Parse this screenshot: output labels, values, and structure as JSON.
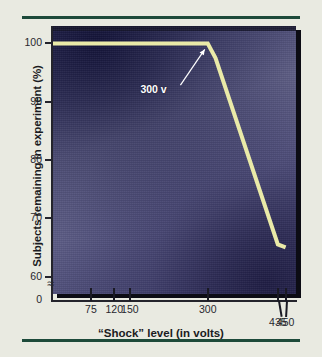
{
  "figure": {
    "background_color": "#e9eae1",
    "rule_color": "#1d4a3a",
    "plot_background_color": "#5a5a84",
    "line_color": "#eaeaa8",
    "annotation_color": "#ffffff"
  },
  "chart_data": {
    "type": "line",
    "title": "",
    "subtitle": "",
    "xlabel": "“Shock” level (in volts)",
    "ylabel": "Subjects remaining in experiment (%)",
    "xlim": [
      0,
      470
    ],
    "ylim": [
      57,
      103
    ],
    "grid": false,
    "legend": "none",
    "y_axis_break": true,
    "y_axis_break_glyph": "≈",
    "x_ticks": [
      {
        "value": 75,
        "label": "75",
        "label_offset": "normal"
      },
      {
        "value": 120,
        "label": "120",
        "label_offset": "normal"
      },
      {
        "value": 150,
        "label": "150",
        "label_offset": "normal"
      },
      {
        "value": 300,
        "label": "300",
        "label_offset": "normal"
      },
      {
        "value": 435,
        "label": "435",
        "label_offset": "low"
      },
      {
        "value": 450,
        "label": "450",
        "label_offset": "low"
      }
    ],
    "y_ticks": [
      {
        "value": 100,
        "label": "100"
      },
      {
        "value": 90,
        "label": "90"
      },
      {
        "value": 80,
        "label": "80"
      },
      {
        "value": 70,
        "label": "70"
      },
      {
        "value": 60,
        "label": "60"
      },
      {
        "value": 0,
        "label": "0"
      }
    ],
    "series": [
      {
        "name": "Subjects remaining",
        "color": "#eaeaa8",
        "points": [
          {
            "x": 0,
            "y": 100.0
          },
          {
            "x": 75,
            "y": 100.0
          },
          {
            "x": 120,
            "y": 100.0
          },
          {
            "x": 150,
            "y": 100.0
          },
          {
            "x": 300,
            "y": 100.0
          },
          {
            "x": 315,
            "y": 97.5
          },
          {
            "x": 435,
            "y": 65.5
          },
          {
            "x": 450,
            "y": 65.0
          }
        ]
      }
    ],
    "annotations": [
      {
        "text": "300 v",
        "target_x": 300,
        "target_y": 99.5,
        "label_x": 205,
        "label_y": 92.0,
        "arrow": true,
        "color": "#ffffff"
      }
    ]
  }
}
